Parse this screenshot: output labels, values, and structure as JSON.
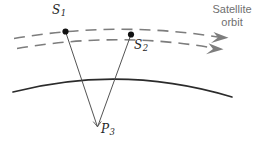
{
  "figure": {
    "background_color": "#ffffff",
    "width": 271,
    "height": 145
  },
  "labels": {
    "satellite_1": {
      "symbol": "S",
      "subscript": "1",
      "x": 52,
      "y": 6
    },
    "satellite_2": {
      "symbol": "S",
      "subscript": "2",
      "x": 134,
      "y": 40
    },
    "ground_point": {
      "symbol": "P",
      "subscript": "3",
      "x": 101,
      "y": 126
    },
    "orbit_caption_line1": "Satellite",
    "orbit_caption_line2": "orbit"
  },
  "colors": {
    "orbit_dash": "#7d7d7d",
    "orbit_arrow": "#7d7d7d",
    "earth_arc": "#2b2b2b",
    "sight_line": "#4a4a4a",
    "marker_dot": "#111111",
    "caption_text": "#6f6f6f",
    "label_text": "#262626",
    "angle_marker": "#555555"
  },
  "geometry": {
    "orbit_arc_upper": {
      "name": "upper-orbit-track",
      "path": "M 14 38.5 Q 118 20.5 221 37.5",
      "dasharray": "11 7",
      "width": 1.6
    },
    "orbit_arc_lower": {
      "name": "lower-orbit-track",
      "path": "M 17 48.5 Q 119 31.0 216 48.5",
      "dasharray": "11 7",
      "width": 1.6
    },
    "arrow_upper": {
      "name": "upper-orbit-arrowhead",
      "points": "228.5,37.8 213.5,32.0 218.0,37.6 211.0,43.0"
    },
    "arrow_lower": {
      "name": "lower-orbit-arrowhead",
      "points": "223.5,49.2 208.5,43.2 213.0,48.9 206.0,54.2"
    },
    "earth_arc": {
      "name": "earth-surface-arc",
      "path": "M 13 92 Q 122 64 232 97",
      "width": 1.7
    },
    "sight_line_1": {
      "name": "line-of-sight-s1-p3",
      "x1": 65.5,
      "y1": 31.5,
      "x2": 97.5,
      "y2": 127.0
    },
    "sight_line_2": {
      "name": "line-of-sight-s2-p3",
      "x1": 131.0,
      "y1": 34.5,
      "x2": 97.5,
      "y2": 127.0
    },
    "dot_s1": {
      "name": "satellite-1-marker",
      "cx": 65.5,
      "cy": 31.5,
      "r": 3.1
    },
    "dot_s2": {
      "name": "satellite-2-marker",
      "cx": 131.0,
      "cy": 34.5,
      "r": 3.1
    },
    "angle_marker": {
      "name": "angle-square-marker",
      "path": "M 93.2 121.6 L 97.4 126.6 L 101.3 121.4",
      "width": 0.9
    }
  }
}
